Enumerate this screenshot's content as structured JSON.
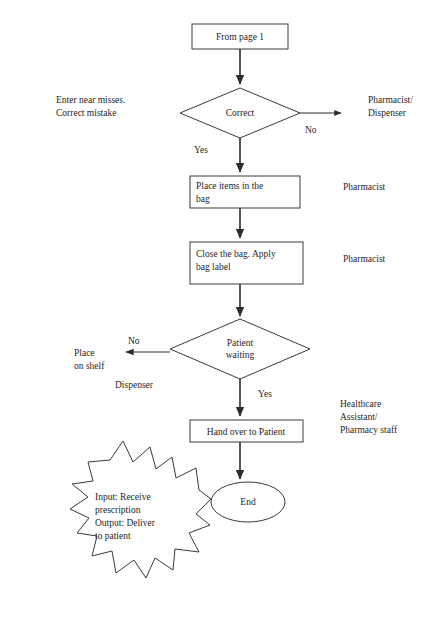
{
  "diagram": {
    "colors": {
      "background": "#ffffff",
      "stroke": "#3a3a3a",
      "connector": "#2b2b2b",
      "text": "#262626"
    },
    "nodes": {
      "from_page": {
        "label": "From page 1",
        "shape": "process"
      },
      "correct": {
        "label": "Correct",
        "shape": "decision"
      },
      "place_items": {
        "line1": "Place items in the",
        "line2": "bag",
        "shape": "process"
      },
      "close_bag": {
        "line1": "Close the bag. Apply",
        "line2": "bag label",
        "shape": "process"
      },
      "patient_waiting": {
        "line1": "Patient",
        "line2": "waiting",
        "shape": "decision"
      },
      "hand_over": {
        "label": "Hand over to Patient",
        "shape": "process"
      },
      "end": {
        "label": "End",
        "shape": "terminator"
      },
      "starburst": {
        "line1": "Input: Receive",
        "line2": "prescription",
        "line3": "Output: Deliver",
        "line4": "to patient",
        "shape": "starburst"
      }
    },
    "edge_labels": {
      "correct_no": "No",
      "correct_yes": "Yes",
      "patient_no": "No",
      "patient_yes": "Yes"
    },
    "annotations": {
      "near_misses_line1": "Enter near misses.",
      "near_misses_line2": "Correct mistake",
      "place_on_shelf_line1": "Place",
      "place_on_shelf_line2": "on shelf"
    },
    "roles": {
      "pharmacist_dispenser_line1": "Pharmacist/",
      "pharmacist_dispenser_line2": "Dispenser",
      "pharmacist_place_items": "Pharmacist",
      "pharmacist_close_bag": "Pharmacist",
      "dispenser_shelf": "Dispenser",
      "healthcare_line1": "Healthcare",
      "healthcare_line2": "Assistant/",
      "healthcare_line3": "Pharmacy staff"
    }
  }
}
